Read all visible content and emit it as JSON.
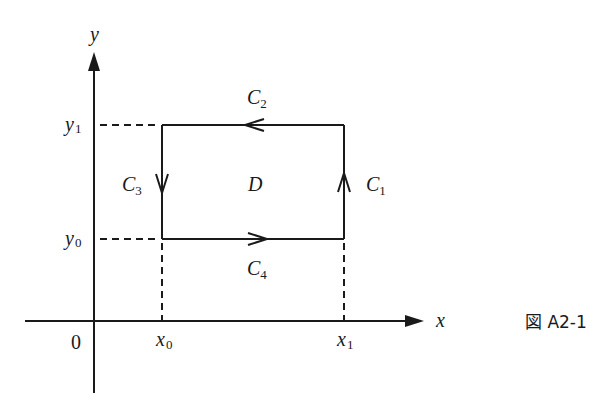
{
  "diagram": {
    "caption": "図 A2-1",
    "axes": {
      "x_label": "x",
      "y_label": "y",
      "origin_label": "0"
    },
    "ticks": {
      "x0": {
        "base": "x",
        "sub": "0"
      },
      "x1": {
        "base": "x",
        "sub": "1"
      },
      "y0": {
        "base": "y",
        "sub": "0"
      },
      "y1": {
        "base": "y",
        "sub": "1"
      }
    },
    "region_label": "D",
    "curves": [
      {
        "id": "C1",
        "base": "C",
        "sub": "1",
        "edge": "right",
        "direction": "up"
      },
      {
        "id": "C2",
        "base": "C",
        "sub": "2",
        "edge": "top",
        "direction": "left"
      },
      {
        "id": "C3",
        "base": "C",
        "sub": "3",
        "edge": "left",
        "direction": "down"
      },
      {
        "id": "C4",
        "base": "C",
        "sub": "4",
        "edge": "bottom",
        "direction": "right"
      }
    ],
    "colors": {
      "stroke": "#1a1a1a",
      "background": "#ffffff"
    }
  }
}
